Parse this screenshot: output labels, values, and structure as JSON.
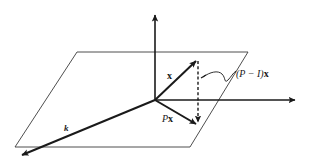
{
  "diagram": {
    "colors": {
      "background": "#ffffff",
      "ink": "#1a1a1a",
      "plane_edge": "#3a3a3a"
    },
    "labels": {
      "x_vector": "x",
      "projection": "Px",
      "projection_P": "P",
      "projection_x": "x",
      "residual": "(P − I)x",
      "residual_prefix": "(P − I)",
      "residual_x": "x",
      "axis_k": "k"
    },
    "elements": {
      "plane": "parallelogram plane",
      "vertical_axis": "vertical axis arrow",
      "horizontal_axis": "horizontal axis arrow",
      "depth_axis": "depth axis arrow (k)",
      "vector_x": "vector x",
      "vector_Px": "projected vector Px",
      "residual_dashed": "dashed residual segment",
      "leader": "curly leader line"
    }
  }
}
